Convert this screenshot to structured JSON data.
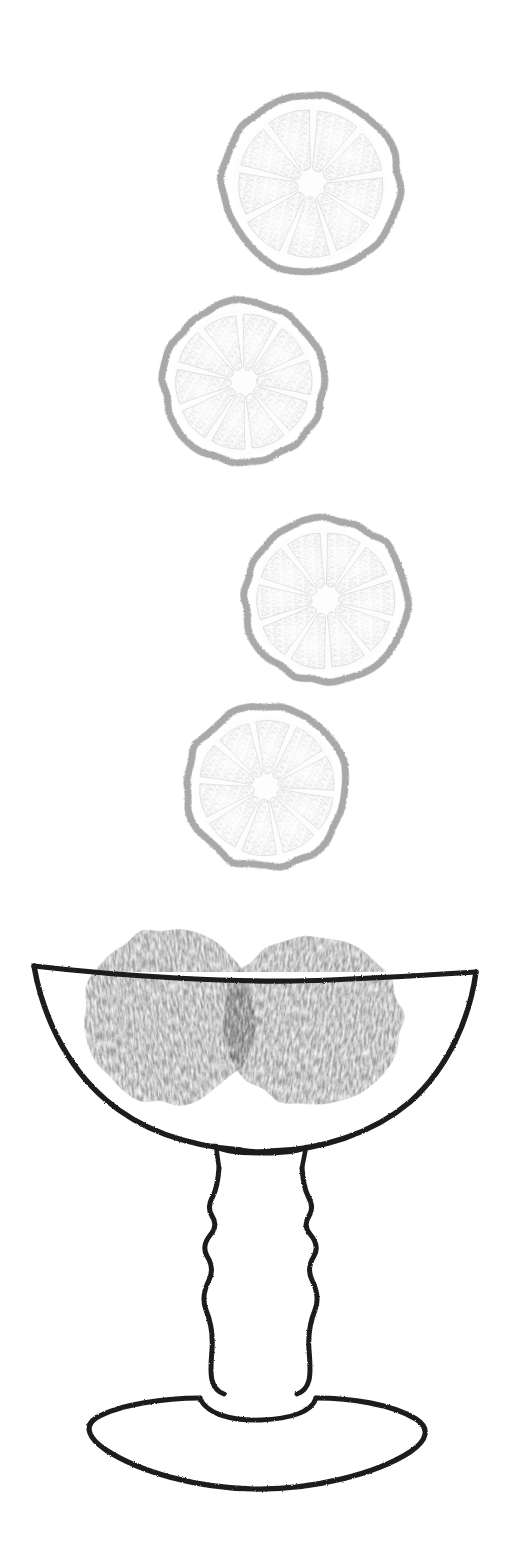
{
  "artwork": {
    "title": "Citrus slices above a footed coupe glass",
    "medium": "hand-drawn line illustration, grayscale",
    "background_color": "#ffffff",
    "canvas": {
      "width": 520,
      "height": 1559
    }
  },
  "palette": {
    "background": "#ffffff",
    "ink_outline": "#1d1d1b",
    "peel_gray": "#a9a9a9",
    "pulp_gray": "#e6e6e6",
    "vesicle_gray": "#dedede",
    "fruit_fill": "#9d9d9d",
    "fruit_overlap": "#868686",
    "fruit_speckle": "#f2f2f2"
  },
  "citrus_slices": [
    {
      "name": "slice-top",
      "label": "Citrus slice 1",
      "cx": 311,
      "cy": 184,
      "r": 92,
      "inner_r": 74,
      "segments": 9,
      "rotation": -8,
      "peel_stroke_width": 7
    },
    {
      "name": "slice-second",
      "label": "Citrus slice 2",
      "cx": 244,
      "cy": 382,
      "r": 84,
      "inner_r": 68,
      "segments": 10,
      "rotation": 14,
      "peel_stroke_width": 7
    },
    {
      "name": "slice-third",
      "label": "Citrus slice 3",
      "cx": 326,
      "cy": 600,
      "r": 85,
      "inner_r": 69,
      "segments": 10,
      "rotation": -20,
      "peel_stroke_width": 7
    },
    {
      "name": "slice-fourth",
      "label": "Citrus slice 4",
      "cx": 266,
      "cy": 787,
      "r": 84,
      "inner_r": 68,
      "segments": 10,
      "rotation": 6,
      "peel_stroke_width": 7
    }
  ],
  "glass": {
    "label": "Footed coupe glass",
    "stroke_color": "#1d1d1b",
    "stroke_width": 5.5,
    "rim": {
      "left_x": 34,
      "left_y": 966,
      "right_x": 476,
      "right_y": 972
    },
    "bowl": {
      "bottom_y": 1122,
      "depth": 156
    },
    "stem": {
      "top_y": 1128,
      "bottom_y": 1386,
      "min_width": 42,
      "max_width": 72
    },
    "foot": {
      "cx": 256,
      "cy": 1430,
      "rx": 170,
      "ry": 48
    },
    "collar": {
      "cx": 256,
      "cy": 1392,
      "rx": 58,
      "ry": 19
    }
  },
  "fruits_in_glass": [
    {
      "name": "fruit-left",
      "label": "Whole fruit, left",
      "cx": 170,
      "cy": 1016,
      "rx": 86,
      "ry": 88,
      "rotation": -6
    },
    {
      "name": "fruit-right",
      "label": "Whole fruit, right",
      "cx": 312,
      "cy": 1022,
      "rx": 90,
      "ry": 84,
      "rotation": 8
    }
  ],
  "chart_data": {
    "type": "scatter",
    "title": "Citrus slices above a footed coupe glass",
    "xlabel": "",
    "ylabel": "",
    "xlim": [
      0,
      520
    ],
    "ylim": [
      0,
      1559
    ],
    "grid": false,
    "legend": "none",
    "series": [
      {
        "name": "citrus slices",
        "x": [
          311,
          244,
          326,
          266
        ],
        "y": [
          184,
          382,
          600,
          787
        ],
        "radius": [
          92,
          84,
          85,
          84
        ],
        "segments": [
          9,
          10,
          10,
          10
        ]
      },
      {
        "name": "fruits in glass",
        "x": [
          170,
          312
        ],
        "y": [
          1016,
          1022
        ],
        "radius": [
          87,
          87
        ]
      }
    ]
  }
}
